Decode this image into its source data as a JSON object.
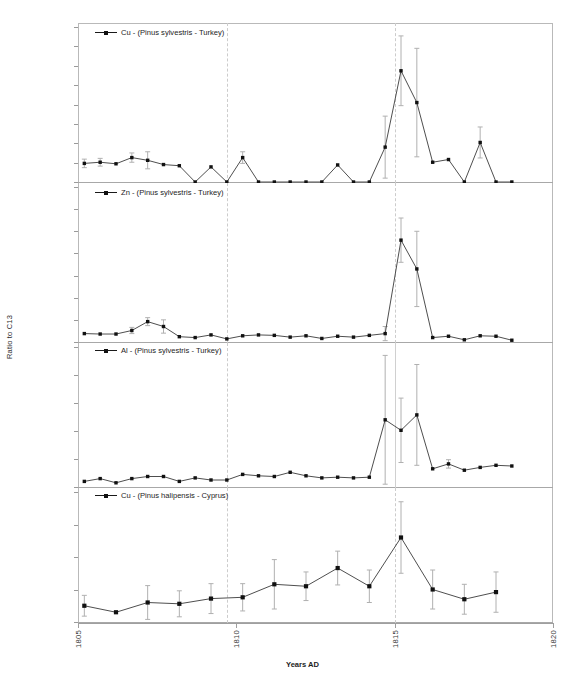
{
  "figure": {
    "ylabel": "Ratio to C13",
    "xlabel": "Years AD",
    "xticks": [
      "1805",
      "1810",
      "1815",
      "1820"
    ],
    "xlim": [
      1805,
      1820
    ],
    "marker_color": "#111111",
    "line_color": "#3a3a3a",
    "errorbar_color": "#b0b0b0",
    "event_line_color": "#cccccc",
    "event_years": [
      1809.7,
      1815.0
    ]
  },
  "chart_data": [
    {
      "type": "line",
      "panel": 1,
      "legend": "Cu - (Pinus sylvestris - Turkey)",
      "element": "Cu",
      "species": "Pinus sylvestris",
      "location": "Turkey",
      "ylabel": "Ratio to C13",
      "xlabel": "Years AD",
      "ylim": [
        0,
        4e-05
      ],
      "ytick_step": 5e-06,
      "yticks": [
        "0.00E+00",
        "5.00E-06",
        "1.00E-05",
        "1.50E-05",
        "2.00E-05",
        "2.50E-05",
        "3.00E-05",
        "3.50E-05",
        "4.00E-05"
      ],
      "grid": false,
      "x": [
        1805.2,
        1805.7,
        1806.2,
        1806.7,
        1807.2,
        1807.7,
        1808.2,
        1808.7,
        1809.2,
        1809.7,
        1810.2,
        1810.7,
        1811.2,
        1811.7,
        1812.2,
        1812.7,
        1813.2,
        1813.7,
        1814.2,
        1814.7,
        1815.2,
        1815.7,
        1816.2,
        1816.7,
        1817.2,
        1817.7,
        1818.2,
        1818.7
      ],
      "y": [
        4.8e-06,
        5.1e-06,
        4.7e-06,
        6.3e-06,
        5.6e-06,
        4.5e-06,
        4.2e-06,
        0.0,
        3.9e-06,
        0.0,
        6.3e-06,
        0.0,
        0.0,
        0.0,
        0.0,
        0.0,
        4.4e-06,
        0.0,
        0.0,
        9e-06,
        2.87e-05,
        2.05e-05,
        5.1e-06,
        5.8e-06,
        0.0,
        1.02e-05,
        0.0,
        0.0
      ],
      "yerr": [
        1.1e-06,
        1e-06,
        0.0,
        1.2e-06,
        2.2e-06,
        0.0,
        0.0,
        0.0,
        0.0,
        0.0,
        1.5e-06,
        0.0,
        0.0,
        0.0,
        0.0,
        0.0,
        0.0,
        0.0,
        0.0,
        8e-06,
        9e-06,
        1.4e-05,
        0.0,
        0.0,
        0.0,
        4e-06,
        0.0,
        0.0
      ]
    },
    {
      "type": "line",
      "panel": 2,
      "legend": "Zn - (Pinus sylvestris - Turkey)",
      "element": "Zn",
      "species": "Pinus sylvestris",
      "location": "Turkey",
      "ylabel": "Ratio to C13",
      "xlabel": "Years AD",
      "ylim": [
        0,
        0.00035
      ],
      "ytick_step": 5e-05,
      "yticks": [
        "0.00E+00",
        "5.00E-05",
        "1.00E-04",
        "1.50E-04",
        "2.00E-04",
        "2.50E-04",
        "3.00E-04",
        "3.50E-04"
      ],
      "grid": false,
      "x": [
        1805.2,
        1805.7,
        1806.2,
        1806.7,
        1807.2,
        1807.7,
        1808.2,
        1808.7,
        1809.2,
        1809.7,
        1810.2,
        1810.7,
        1811.2,
        1811.7,
        1812.2,
        1812.7,
        1813.2,
        1813.7,
        1814.2,
        1814.7,
        1815.2,
        1815.7,
        1816.2,
        1816.7,
        1817.2,
        1817.7,
        1818.2,
        1818.7
      ],
      "y": [
        1.9e-05,
        1.8e-05,
        1.8e-05,
        2.6e-05,
        4.6e-05,
        3.5e-05,
        1.2e-05,
        1e-05,
        1.6e-05,
        7e-06,
        1.4e-05,
        1.6e-05,
        1.5e-05,
        1.1e-05,
        1.4e-05,
        8e-06,
        1.3e-05,
        1.1e-05,
        1.5e-05,
        1.9e-05,
        0.00023,
        0.000165,
        1e-05,
        1.3e-05,
        5e-06,
        1.4e-05,
        1.3e-05,
        4e-06
      ],
      "yerr": [
        0.0,
        0.0,
        0.0,
        7e-06,
        9e-06,
        1.5e-05,
        0.0,
        0.0,
        0.0,
        0.0,
        0.0,
        0.0,
        0.0,
        0.0,
        0.0,
        0.0,
        0.0,
        0.0,
        0.0,
        1.6e-05,
        5e-05,
        8.5e-05,
        0.0,
        0.0,
        0.0,
        0.0,
        0.0,
        0.0
      ]
    },
    {
      "type": "line",
      "panel": 3,
      "legend": "Al - (Pinus sylvestris - Turkey)",
      "element": "Al",
      "species": "Pinus sylvestris",
      "location": "Turkey",
      "ylabel": "Ratio to C13",
      "xlabel": "Years AD",
      "ylim": [
        0,
        0.0001
      ],
      "ytick_step": 2e-05,
      "yticks": [
        "0.00E+00",
        "2.00E-05",
        "4.00E-05",
        "6.00E-05",
        "8.00E-05",
        "1.00E-04"
      ],
      "grid": false,
      "x": [
        1805.2,
        1805.7,
        1806.2,
        1806.7,
        1807.2,
        1807.7,
        1808.2,
        1808.7,
        1809.2,
        1809.7,
        1810.2,
        1810.7,
        1811.2,
        1811.7,
        1812.2,
        1812.7,
        1813.2,
        1813.7,
        1814.2,
        1814.7,
        1815.2,
        1815.7,
        1816.2,
        1816.7,
        1817.2,
        1817.7,
        1818.2,
        1818.7
      ],
      "y": [
        4e-06,
        6e-06,
        3e-06,
        6e-06,
        7.5e-06,
        7.5e-06,
        4e-06,
        6.5e-06,
        5e-06,
        5e-06,
        9e-06,
        8e-06,
        7.5e-06,
        1.05e-05,
        8e-06,
        6.5e-06,
        7e-06,
        6.5e-06,
        7e-06,
        4.8e-05,
        4.05e-05,
        5.15e-05,
        1.3e-05,
        1.65e-05,
        1.2e-05,
        1.4e-05,
        1.55e-05,
        1.5e-05
      ],
      "yerr": [
        0.0,
        0.0,
        0.0,
        0.0,
        0.0,
        0.0,
        0.0,
        0.0,
        0.0,
        0.0,
        0.0,
        0.0,
        0.0,
        0.0,
        0.0,
        0.0,
        0.0,
        0.0,
        0.0,
        4.6e-05,
        2.3e-05,
        3.6e-05,
        0.0,
        3e-06,
        0.0,
        0.0,
        0.0,
        0.0
      ]
    },
    {
      "type": "line",
      "panel": 4,
      "legend": "Cu - (Pinus halipensis - Cyprus)",
      "element": "Cu",
      "species": "Pinus halipensis",
      "location": "Cyprus",
      "ylabel": "Ratio to C13",
      "xlabel": "Years AD",
      "ylim": [
        0,
        0.0002
      ],
      "ytick_step": 5e-05,
      "yticks": [
        "0.00E+00",
        "5.00E-05",
        "1.00E-04",
        "1.50E-04",
        "2.00E-04"
      ],
      "grid": false,
      "x": [
        1805.2,
        1806.2,
        1807.2,
        1808.2,
        1809.2,
        1810.2,
        1811.2,
        1812.2,
        1813.2,
        1814.2,
        1815.2,
        1816.2,
        1817.2,
        1818.2
      ],
      "y": [
        2.5e-05,
        1.5e-05,
        3e-05,
        2.8e-05,
        3.6e-05,
        3.8e-05,
        5.8e-05,
        5.5e-05,
        8.3e-05,
        5.5e-05,
        0.00013,
        5e-05,
        3.5e-05,
        4.6e-05
      ],
      "yerr": [
        1.6e-05,
        0.0,
        2.6e-05,
        2e-05,
        2.3e-05,
        2.1e-05,
        3.8e-05,
        2.2e-05,
        2.6e-05,
        2.5e-05,
        5.5e-05,
        3e-05,
        2.3e-05,
        3.1e-05
      ]
    }
  ]
}
